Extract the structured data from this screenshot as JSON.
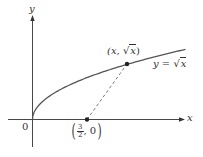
{
  "chart_data": {
    "type": "line",
    "title": "",
    "xlabel": "x",
    "ylabel": "y",
    "origin_label": "0",
    "series": [
      {
        "name": "y = √x",
        "label": "y = √x",
        "function": "sqrt(x)",
        "color": "#555555"
      }
    ],
    "points": [
      {
        "label": "(x, √x)",
        "role": "point on curve"
      },
      {
        "label": "(3/2, 0)",
        "x": 1.5,
        "y": 0,
        "role": "point on x-axis"
      }
    ],
    "annotations": [
      {
        "type": "dashed-line",
        "from": "(3/2, 0)",
        "to": "(x, √x)"
      }
    ],
    "grid": false,
    "legend": "none"
  },
  "labels": {
    "y_axis": "y",
    "x_axis": "x",
    "origin": "0",
    "curve_eq_lhs": "y = ",
    "curve_eq_rad": "x",
    "point_curve_open": "(x, ",
    "point_curve_rad": "x",
    "point_curve_close": ")",
    "point_axis_num": "3",
    "point_axis_den": "2",
    "point_axis_y": ", 0",
    "paren_open": "(",
    "paren_close": ")"
  },
  "colors": {
    "curve": "#555555",
    "axis": "#333333",
    "dashed": "#666666",
    "point": "#222222"
  }
}
